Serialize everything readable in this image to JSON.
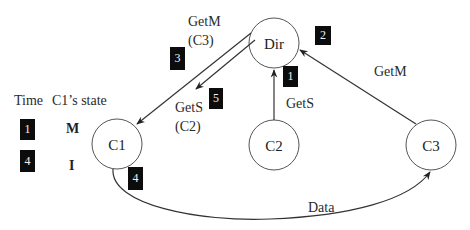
{
  "nodes": [
    {
      "id": "dir",
      "label": "Dir"
    },
    {
      "id": "c1",
      "label": "C1"
    },
    {
      "id": "c2",
      "label": "C2"
    },
    {
      "id": "c3",
      "label": "C3"
    }
  ],
  "edges": [
    {
      "from": "C2",
      "to": "Dir",
      "label": "GetS",
      "step": "1"
    },
    {
      "from": "C3",
      "to": "Dir",
      "label": "GetM",
      "step": "2"
    },
    {
      "from": "Dir",
      "to": "C1",
      "label": "GetM",
      "sublabel": "(C3)",
      "step": "3"
    },
    {
      "from": "C1",
      "to": "C3",
      "label": "Data",
      "step": "4"
    },
    {
      "from": "Dir",
      "to": "C1",
      "label": "GetS",
      "sublabel": "(C2)",
      "step": "5"
    }
  ],
  "legend": {
    "time_header": "Time",
    "state_header": "C1’s state",
    "rows": [
      {
        "time": "1",
        "state": "M"
      },
      {
        "time": "4",
        "state": "I"
      }
    ]
  },
  "colors": {
    "badge_bg": "#0c0c0c",
    "badge_text": "#f2f2f2",
    "line": "#333333"
  }
}
